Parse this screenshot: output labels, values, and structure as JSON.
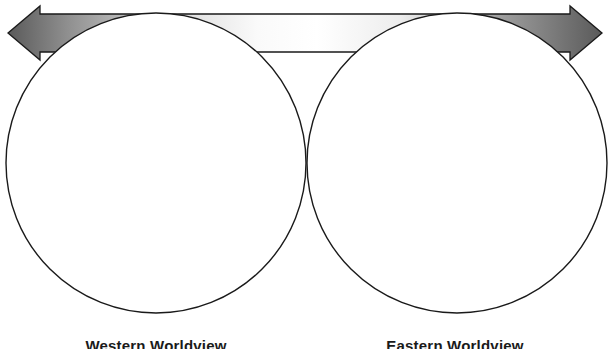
{
  "diagram": {
    "type": "venn-two-circle-with-spectrum-arrow",
    "background_color": "#ffffff",
    "arrow": {
      "name": "double-headed-spectrum-arrow",
      "direction": "bidirectional-horizontal",
      "outline_color": "#1a1a1a",
      "gradient_stops": [
        "#5a5a5a",
        "#8f8f8f",
        "#d8d8d8",
        "#fcfcfc",
        "#ffffff",
        "#e8e8e8",
        "#9a9a9a",
        "#5a5a5a"
      ],
      "head_color": "#555555",
      "left_tip_x": 8,
      "right_tip_x": 602,
      "bar_top_y": 13,
      "bar_bottom_y": 57
    },
    "circles": [
      {
        "name": "left-circle",
        "center_x": 156,
        "center_y": 163,
        "radius": 150,
        "fill": "#ffffff",
        "stroke": "#1a1a1a",
        "stroke_width": 1.4
      },
      {
        "name": "right-circle",
        "center_x": 457,
        "center_y": 163,
        "radius": 150,
        "fill": "#ffffff",
        "stroke": "#1a1a1a",
        "stroke_width": 1.4
      }
    ],
    "captions": {
      "left": "Western Worldview",
      "right": "Eastern Worldview"
    }
  }
}
